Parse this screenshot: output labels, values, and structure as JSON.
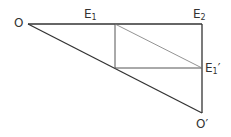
{
  "diagram": {
    "labels": {
      "O": "O",
      "E1": "E",
      "E1_sub": "1",
      "E2": "E",
      "E2_sub": "2",
      "E1p": "E",
      "E1p_sub": "1",
      "E1p_prime": "′",
      "Op": "O′"
    },
    "colors": {
      "line": "#333333",
      "thin": "#666666"
    }
  }
}
